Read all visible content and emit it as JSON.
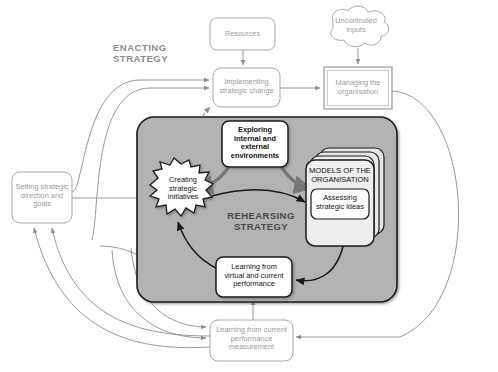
{
  "diagram": {
    "title_enacting": "ENACTING\nSTRATEGY",
    "title_enacting_line1": "ENACTING",
    "title_enacting_line2": "STRATEGY",
    "title_rehearsing_line1": "REHEARSING",
    "title_rehearsing_line2": "STRATEGY",
    "colors": {
      "gray_panel": "#b3b3b3",
      "gray_stroke": "#8c8c8c",
      "black_stroke": "#1a1a1a",
      "thick_arrow": "#777777",
      "box_fill": "#ffffff",
      "model_card_fill": "#e8e8e8",
      "background": "#ffffff"
    },
    "nodes": [
      {
        "id": "resources",
        "label": "Resources",
        "shape": "rounded-rect",
        "style": "gray",
        "x": 210,
        "y": 18,
        "w": 65,
        "h": 32
      },
      {
        "id": "uncontrolled-inputs",
        "label": "Uncontrolled\ninputs",
        "label_lines": [
          "Uncontrolled",
          "inputs"
        ],
        "shape": "cloud",
        "style": "gray",
        "x": 322,
        "y": 10,
        "w": 68,
        "h": 40
      },
      {
        "id": "implementing-strategic-change",
        "label": "Implementing\nstrategic change",
        "label_lines": [
          "Implementing",
          "strategic change"
        ],
        "shape": "rounded-rect",
        "style": "gray",
        "x": 213,
        "y": 68,
        "w": 67,
        "h": 39
      },
      {
        "id": "managing-the-organisation",
        "label": "Managing the\norganisation",
        "label_lines": [
          "Managing the",
          "organisation"
        ],
        "shape": "double-rect",
        "style": "gray",
        "x": 324,
        "y": 67,
        "w": 68,
        "h": 42
      },
      {
        "id": "setting-strategic-direction",
        "label": "Setting strategic\ndirection and\ngoals",
        "label_lines": [
          "Setting strategic",
          "direction and",
          "goals"
        ],
        "shape": "rounded-rect",
        "style": "gray",
        "x": 12,
        "y": 172,
        "w": 60,
        "h": 51
      },
      {
        "id": "exploring-environments",
        "label": "Exploring\ninternal and\nexternal\nenvironments",
        "label_lines": [
          "Exploring",
          "internal and",
          "external",
          "environments"
        ],
        "shape": "rounded-rect",
        "style": "black-bold",
        "x": 222,
        "y": 121,
        "w": 66,
        "h": 46
      },
      {
        "id": "creating-strategic-initiatives",
        "label": "Creating\nstrategic\ninitiatives",
        "label_lines": [
          "Creating",
          "strategic",
          "initiatives"
        ],
        "shape": "jagged-cloud",
        "style": "black",
        "x": 149,
        "y": 166,
        "w": 70,
        "h": 54
      },
      {
        "id": "models-of-the-organisation",
        "label": "MODELS OF THE\nORGANISATION",
        "label_lines": [
          "MODELS OF THE",
          "ORGANISATION"
        ],
        "shape": "card-stack",
        "style": "black",
        "x": 306,
        "y": 148,
        "w": 78,
        "h": 93
      },
      {
        "id": "assessing-strategic-ideas",
        "label": "Assessing\nstrategic ideas",
        "label_lines": [
          "Assessing",
          "strategic ideas"
        ],
        "shape": "rounded-rect",
        "style": "black",
        "x": 311,
        "y": 189,
        "w": 69,
        "h": 30
      },
      {
        "id": "learning-virtual-current",
        "label": "Learning from\nvirtual and current\nperformance",
        "label_lines": [
          "Learning from",
          "virtual and current",
          "performance"
        ],
        "shape": "rounded-rect",
        "style": "black",
        "x": 216,
        "y": 257,
        "w": 76,
        "h": 40
      },
      {
        "id": "learning-current-measurement",
        "label": "Learning from current\nperformance\nmeasurement",
        "label_lines": [
          "Learning from current",
          "performance",
          "measurement"
        ],
        "shape": "rounded-rect",
        "style": "gray",
        "x": 210,
        "y": 320,
        "w": 83,
        "h": 41
      }
    ],
    "regions": [
      {
        "id": "rehearsing-strategy-panel",
        "label": "REHEARSING STRATEGY",
        "x": 137,
        "y": 117,
        "w": 260,
        "h": 185
      },
      {
        "id": "enacting-strategy-label",
        "label": "ENACTING STRATEGY",
        "x": 113,
        "y": 43
      }
    ],
    "edges": [
      {
        "from": "resources",
        "to": "implementing-strategic-change",
        "style": "gray-straight"
      },
      {
        "from": "uncontrolled-inputs",
        "to": "managing-the-organisation",
        "style": "gray-straight"
      },
      {
        "from": "implementing-strategic-change",
        "to": "managing-the-organisation",
        "style": "gray-straight"
      },
      {
        "from": "creating-strategic-initiatives",
        "to": "implementing-strategic-change",
        "style": "gray-dashed"
      },
      {
        "from": "setting-strategic-direction",
        "to": "implementing-strategic-change",
        "style": "gray-curve"
      },
      {
        "from": "setting-strategic-direction",
        "to": "creating-strategic-initiatives",
        "style": "gray-straight"
      },
      {
        "from": "learning-current-measurement",
        "to": "setting-strategic-direction",
        "style": "gray-curve"
      },
      {
        "from": "learning-current-measurement",
        "to": "learning-virtual-current",
        "style": "gray-straight"
      },
      {
        "from": "managing-the-organisation",
        "to": "learning-current-measurement",
        "style": "gray-curve"
      },
      {
        "from": "exploring-environments",
        "to": "creating-strategic-initiatives",
        "style": "thick-gray-curve"
      },
      {
        "from": "exploring-environments",
        "to": "models-of-the-organisation",
        "style": "thick-gray-curve"
      },
      {
        "from": "creating-strategic-initiatives",
        "to": "assessing-strategic-ideas",
        "style": "black-curve"
      },
      {
        "from": "models-of-the-organisation",
        "to": "learning-virtual-current",
        "style": "black-curve"
      },
      {
        "from": "learning-virtual-current",
        "to": "creating-strategic-initiatives",
        "style": "black-curve"
      }
    ]
  }
}
